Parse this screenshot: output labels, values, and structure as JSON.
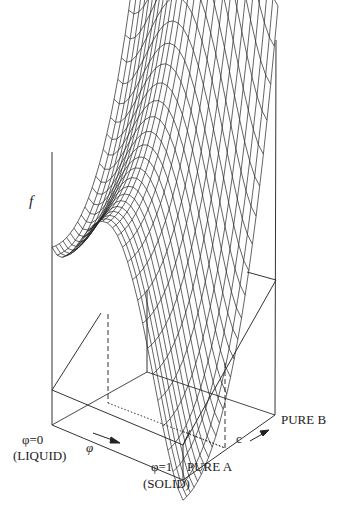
{
  "page_number": "",
  "figure": {
    "kind": "3D wireframe surface plot of free energy",
    "z_axis_label": "f",
    "phi_axis": {
      "label": "φ",
      "start_label": "φ=0",
      "start_sublabel": "(LIQUID)",
      "end_label": "φ=1",
      "end_sublabel": "(SOLID)"
    },
    "c_axis": {
      "label": "c",
      "start_label": "PURE A",
      "end_label": "PURE B"
    }
  }
}
